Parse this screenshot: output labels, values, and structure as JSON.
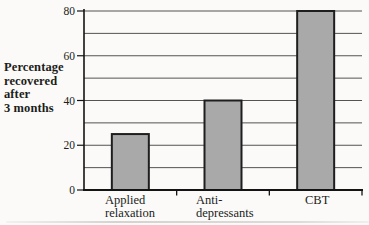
{
  "figure": {
    "background": "#fbfaf8",
    "y_axis_title_lines": [
      "Percentage",
      "recovered",
      "after",
      "3 months"
    ]
  },
  "chart_data": {
    "type": "bar",
    "categories": [
      "Applied relaxation",
      "Anti-depressants",
      "CBT"
    ],
    "values": [
      25,
      40,
      80
    ],
    "title": "",
    "xlabel": "",
    "ylabel": "Percentage recovered after 3 months",
    "ylim": [
      0,
      80
    ],
    "ytick_step": 10,
    "ytick_label_step": 20,
    "ytick_labels": [
      "0",
      "20",
      "40",
      "60",
      "80"
    ],
    "grid": true,
    "legend": false,
    "colors": {
      "bar_fill": "#a9a9a9",
      "bar_border": "#1e1e1e",
      "grid": "#535353",
      "axis": "#141414",
      "text": "#201d1a"
    }
  }
}
